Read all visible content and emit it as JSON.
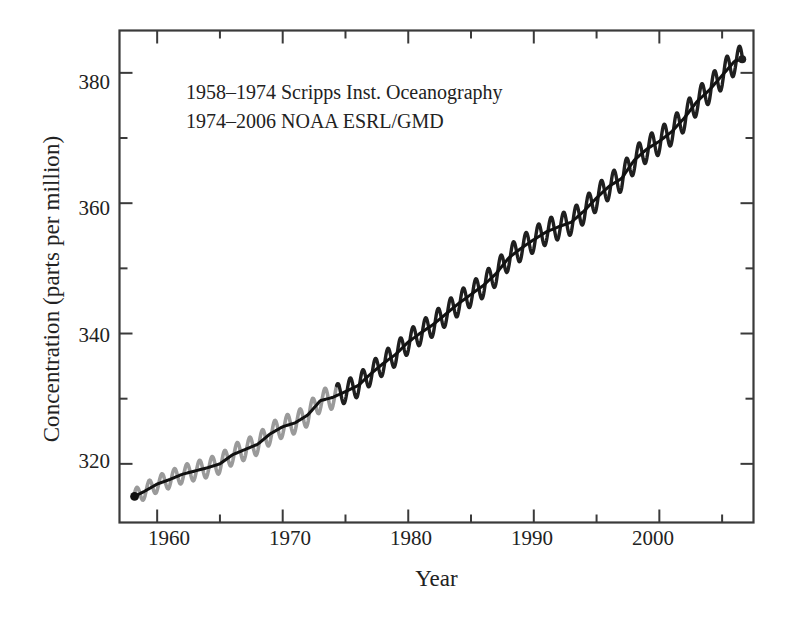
{
  "chart_data": {
    "type": "line",
    "title": "",
    "xlabel": "Year",
    "ylabel": "Concentration (parts per million)",
    "xlim": [
      1957.0,
      2007.5
    ],
    "ylim": [
      311.0,
      386.5
    ],
    "grid": false,
    "legend_position": "none",
    "xticks_major": [
      1960,
      1970,
      1980,
      1990,
      2000
    ],
    "xticks_minor": [
      1965,
      1975,
      1985,
      1995,
      2005
    ],
    "yticks_major": [
      320,
      340,
      360,
      380
    ],
    "yticks_minor": [
      330,
      350,
      370
    ],
    "annotations": [
      "1958–1974 Scripps Inst. Oceanography",
      "1974–2006 NOAA ESRL/GMD"
    ],
    "series": [
      {
        "name": "Scripps Inst. Oceanography",
        "color": "#9a9a9a",
        "x_range": [
          1958.2,
          1974.3
        ],
        "style": "seasonal-oscillation-envelope"
      },
      {
        "name": "NOAA ESRL/GMD",
        "color": "#1f1f1f",
        "x_range": [
          1974.3,
          2006.6
        ],
        "style": "seasonal-oscillation-envelope"
      },
      {
        "name": "Annual mean trend",
        "color": "#111111",
        "x_range": [
          1958.2,
          2006.6
        ],
        "style": "trend-line"
      }
    ],
    "x": [
      1958.2,
      1959,
      1960,
      1961,
      1962,
      1963,
      1964,
      1965,
      1966,
      1967,
      1968,
      1969,
      1970,
      1971,
      1972,
      1973,
      1974,
      1975,
      1976,
      1977,
      1978,
      1979,
      1980,
      1981,
      1982,
      1983,
      1984,
      1985,
      1986,
      1987,
      1988,
      1989,
      1990,
      1991,
      1992,
      1993,
      1994,
      1995,
      1996,
      1997,
      1998,
      1999,
      2000,
      2001,
      2002,
      2003,
      2004,
      2005,
      2006,
      2006.6
    ],
    "values": [
      315.0,
      315.8,
      316.9,
      317.6,
      318.4,
      318.9,
      319.4,
      320.0,
      321.4,
      322.2,
      323.0,
      324.6,
      325.7,
      326.3,
      327.5,
      329.7,
      330.2,
      331.1,
      332.0,
      333.8,
      335.4,
      336.8,
      338.7,
      340.1,
      341.4,
      343.0,
      344.6,
      346.0,
      347.4,
      349.2,
      351.6,
      353.1,
      354.4,
      355.6,
      356.4,
      357.1,
      358.8,
      360.8,
      362.6,
      363.8,
      366.6,
      368.3,
      369.5,
      371.0,
      373.1,
      375.6,
      377.4,
      379.6,
      381.8,
      382.1
    ],
    "seasonal_amplitude": [
      2.4,
      2.5,
      2.6,
      2.7,
      2.8,
      2.9,
      3.0,
      3.0,
      3.1,
      3.2,
      3.2,
      3.3,
      3.3,
      3.3,
      3.4,
      3.4,
      3.5,
      3.5,
      3.5,
      3.5,
      3.6,
      3.6,
      3.6,
      3.6,
      3.7,
      3.7,
      3.7,
      3.7,
      3.8,
      3.8,
      3.8,
      3.8,
      3.9,
      3.9,
      3.9,
      3.9,
      3.9,
      4.0,
      4.0,
      4.0,
      4.0,
      4.0,
      4.1,
      4.1,
      4.1,
      4.1,
      4.1,
      4.2,
      4.2,
      4.2
    ]
  },
  "axes": {
    "xlabel": "Year",
    "ylabel": "Concentration (parts per million)",
    "ytick_labels": [
      "380",
      "360",
      "340",
      "320"
    ],
    "xtick_labels": [
      "1960",
      "1970",
      "1980",
      "1990",
      "2000"
    ]
  },
  "annotation": {
    "line1": "1958–1974 Scripps Inst. Oceanography",
    "line2": "1974–2006 NOAA ESRL/GMD"
  },
  "colors": {
    "frame": "#3a3a3a",
    "text": "#222222",
    "scripps_series": "#9a9a9a",
    "noaa_series": "#1f1f1f",
    "trend": "#111111",
    "background": "#ffffff"
  }
}
